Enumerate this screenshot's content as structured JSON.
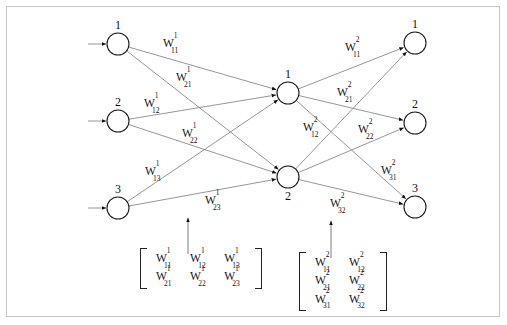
{
  "diagram": {
    "background_color": "#ffffff",
    "border_color": "#c6c6c6",
    "edge_color": "#8a8a8a",
    "node_stroke_color": "#1a1a1a"
  },
  "layers": {
    "input": {
      "name": "input-layer",
      "x": 118,
      "node_radius": 11,
      "nodes": [
        {
          "label": "1",
          "y": 44
        },
        {
          "label": "2",
          "y": 121
        },
        {
          "label": "3",
          "y": 208
        }
      ]
    },
    "hidden": {
      "name": "hidden-layer",
      "x": 288,
      "node_radius": 11,
      "nodes": [
        {
          "label": "1",
          "y": 93
        },
        {
          "label": "2",
          "y": 177
        }
      ]
    },
    "output": {
      "name": "output-layer",
      "x": 415,
      "node_radius": 11,
      "nodes": [
        {
          "label": "1",
          "y": 43
        },
        {
          "label": "2",
          "y": 123
        },
        {
          "label": "3",
          "y": 207
        }
      ]
    }
  },
  "edge_labels": {
    "layer1": [
      {
        "base": "W",
        "sup": "1",
        "sub": "11",
        "x": 163,
        "y": 36
      },
      {
        "base": "W",
        "sup": "1",
        "sub": "21",
        "x": 176,
        "y": 70
      },
      {
        "base": "W",
        "sup": "1",
        "sub": "12",
        "x": 144,
        "y": 96
      },
      {
        "base": "W",
        "sup": "1",
        "sub": "22",
        "x": 182,
        "y": 126
      },
      {
        "base": "W",
        "sup": "1",
        "sub": "13",
        "x": 145,
        "y": 164
      },
      {
        "base": "W",
        "sup": "1",
        "sub": "23",
        "x": 205,
        "y": 193
      }
    ],
    "layer2": [
      {
        "base": "W",
        "sup": "2",
        "sub": "11",
        "x": 345,
        "y": 40
      },
      {
        "base": "W",
        "sup": "2",
        "sub": "21",
        "x": 337,
        "y": 85
      },
      {
        "base": "W",
        "sup": "2",
        "sub": "12",
        "x": 303,
        "y": 120
      },
      {
        "base": "W",
        "sup": "2",
        "sub": "22",
        "x": 358,
        "y": 122
      },
      {
        "base": "W",
        "sup": "2",
        "sub": "31",
        "x": 381,
        "y": 163
      },
      {
        "base": "W",
        "sup": "2",
        "sub": "32",
        "x": 330,
        "y": 196
      }
    ]
  },
  "matrices": [
    {
      "name": "weight-matrix-layer-1",
      "x": 140,
      "y": 248,
      "rows": 2,
      "cols": 3,
      "pointer_arrow": {
        "x": 188,
        "y_from": 254,
        "y_to": 218
      },
      "cells": [
        [
          {
            "base": "W",
            "sup": "1",
            "sub": "11"
          },
          {
            "base": "W",
            "sup": "1",
            "sub": "12"
          },
          {
            "base": "W",
            "sup": "1",
            "sub": "13"
          }
        ],
        [
          {
            "base": "W",
            "sup": "1",
            "sub": "21"
          },
          {
            "base": "W",
            "sup": "1",
            "sub": "22"
          },
          {
            "base": "W",
            "sup": "1",
            "sub": "23"
          }
        ]
      ]
    },
    {
      "name": "weight-matrix-layer-2",
      "x": 299,
      "y": 252,
      "rows": 3,
      "cols": 2,
      "pointer_arrow": {
        "x": 331,
        "y_from": 258,
        "y_to": 221
      },
      "cells": [
        [
          {
            "base": "W",
            "sup": "2",
            "sub": "11"
          },
          {
            "base": "W",
            "sup": "2",
            "sub": "12"
          }
        ],
        [
          {
            "base": "W",
            "sup": "2",
            "sub": "21"
          },
          {
            "base": "W",
            "sup": "2",
            "sub": "22"
          }
        ],
        [
          {
            "base": "W",
            "sup": "2",
            "sub": "31"
          },
          {
            "base": "W",
            "sup": "2",
            "sub": "32"
          }
        ]
      ]
    }
  ],
  "input_arrows": [
    {
      "x_from": 88,
      "x_to": 106,
      "y": 44
    },
    {
      "x_from": 88,
      "x_to": 106,
      "y": 121
    },
    {
      "x_from": 88,
      "x_to": 106,
      "y": 208
    }
  ]
}
